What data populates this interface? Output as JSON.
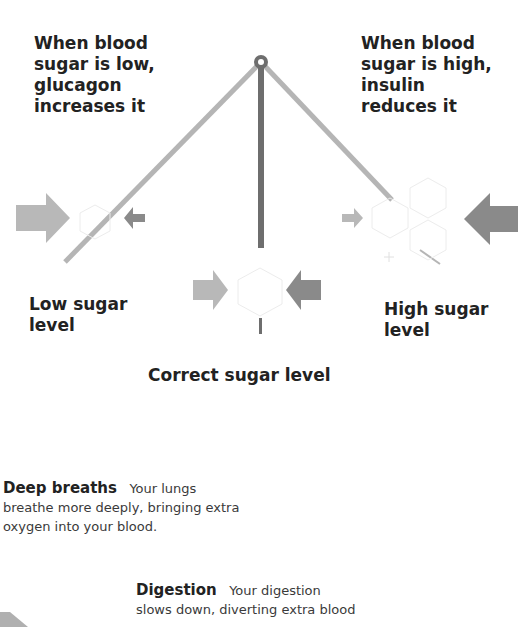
{
  "diagram": {
    "labels": {
      "low_note": [
        "When blood",
        "sugar is low,",
        "glucagon",
        "increases it"
      ],
      "high_note": [
        "When blood",
        "sugar is high,",
        "insulin",
        "reduces it"
      ],
      "low_level": [
        "Low sugar",
        "level"
      ],
      "high_level": [
        "High sugar",
        "level"
      ],
      "correct_level": "Correct sugar level"
    },
    "colors": {
      "pendulum": "#6e6e6e",
      "swing_line": "#b5b5b5",
      "arrow_light": "#b8b8b8",
      "arrow_dark": "#8a8a8a",
      "hexagon": "#e8e8e8"
    }
  },
  "captions": [
    {
      "title": "Deep breaths",
      "text_line1": "Your lungs",
      "text_rest": [
        "breathe more deeply, bringing extra",
        "oxygen into your blood."
      ]
    },
    {
      "title": "Digestion",
      "text_line1": "Your digestion",
      "text_rest": [
        "slows down, diverting extra blood"
      ]
    }
  ]
}
